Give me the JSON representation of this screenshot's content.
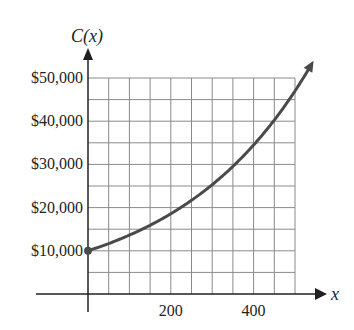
{
  "chart_data": {
    "type": "line",
    "title": "",
    "ylabel": "C(x)",
    "xlabel": "x",
    "xlim": [
      0,
      500
    ],
    "ylim": [
      0,
      50000
    ],
    "grid": true,
    "x_ticks": [
      200,
      400
    ],
    "x_tick_labels": [
      "200",
      "400"
    ],
    "y_ticks": [
      10000,
      20000,
      30000,
      40000,
      50000
    ],
    "y_tick_labels": [
      "$10,000",
      "$20,000",
      "$30,000",
      "$40,000",
      "$50,000"
    ],
    "grid_step_x": 50,
    "grid_step_y": 5000,
    "series": [
      {
        "name": "C(x)",
        "x": [
          0,
          100,
          200,
          300,
          400,
          500,
          540
        ],
        "values": [
          10000,
          13600,
          18600,
          25300,
          34500,
          47000,
          53000
        ],
        "start_point": [
          0,
          10000
        ],
        "end_arrow": true
      }
    ],
    "colors": {
      "curve": "#4a4a4a",
      "grid": "#8a8a8a",
      "axes": "#231f20"
    }
  }
}
